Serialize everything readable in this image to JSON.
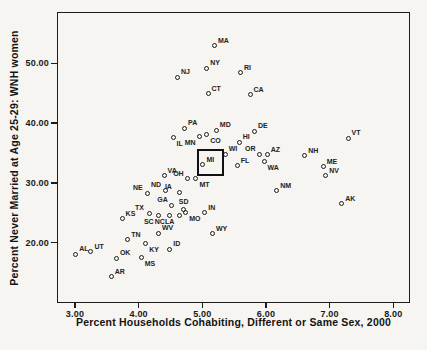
{
  "colors": {
    "background": "#f6f5f2",
    "frame": "#1c1c1c",
    "marker_outline": "#1c1c1c",
    "text": "#141414"
  },
  "chart_data": {
    "type": "scatter",
    "title": "",
    "xlabel": "Percent Households Cohabiting, Different or Same Sex, 2000",
    "ylabel": "Percent Never Married at Age 25-29:  WNH women",
    "xlim": [
      2.72,
      8.26
    ],
    "ylim": [
      10,
      58.5
    ],
    "grid": "off",
    "legend": "none",
    "marker": "open-circle",
    "x_ticks": [
      3,
      4,
      5,
      6,
      7,
      8
    ],
    "x_tick_labels": [
      "3.00",
      "4.00",
      "5.00",
      "6.00",
      "7.00",
      "8.00"
    ],
    "y_ticks": [
      20,
      30,
      40,
      50
    ],
    "y_tick_labels": [
      "20.00",
      "30.00",
      "40.00",
      "50.00"
    ],
    "highlight_square": {
      "x0": 4.92,
      "y0": 31.1,
      "x1": 5.34,
      "y1": 35.6
    },
    "points": [
      {
        "label": "AL",
        "x": 3.01,
        "y": 18.1,
        "label_pos": "ur"
      },
      {
        "label": "UT",
        "x": 3.25,
        "y": 18.5,
        "label_pos": "ur"
      },
      {
        "label": "AR",
        "x": 3.57,
        "y": 14.3,
        "label_pos": "ur"
      },
      {
        "label": "OK",
        "x": 3.65,
        "y": 17.4,
        "label_pos": "ur"
      },
      {
        "label": "KS",
        "x": 3.74,
        "y": 24.0,
        "label_pos": "ur"
      },
      {
        "label": "TN",
        "x": 3.83,
        "y": 20.5,
        "label_pos": "ur"
      },
      {
        "label": "MS",
        "x": 4.04,
        "y": 17.5,
        "label_pos": "br"
      },
      {
        "label": "KY",
        "x": 4.11,
        "y": 19.9,
        "label_pos": "br"
      },
      {
        "label": "NE",
        "x": 4.14,
        "y": 28.3,
        "label_pos": "ul"
      },
      {
        "label": "TX",
        "x": 4.17,
        "y": 24.9,
        "label_pos": "ul"
      },
      {
        "label": "SC",
        "x": 4.31,
        "y": 24.5,
        "label_pos": "bl"
      },
      {
        "label": "WV",
        "x": 4.31,
        "y": 21.6,
        "label_pos": "ur"
      },
      {
        "label": "VA",
        "x": 4.4,
        "y": 31.2,
        "label_pos": "ur"
      },
      {
        "label": "ND",
        "x": 4.42,
        "y": 28.8,
        "label_pos": "ul"
      },
      {
        "label": "NC",
        "x": 4.48,
        "y": 24.6,
        "label_pos": "bl"
      },
      {
        "label": "ID",
        "x": 4.49,
        "y": 18.9,
        "label_pos": "ur"
      },
      {
        "label": "GA",
        "x": 4.52,
        "y": 26.3,
        "label_pos": "ul"
      },
      {
        "label": "IL",
        "x": 4.54,
        "y": 37.6,
        "label_pos": "br"
      },
      {
        "label": "NJ",
        "x": 4.61,
        "y": 47.7,
        "label_pos": "ur"
      },
      {
        "label": "IA",
        "x": 4.64,
        "y": 28.4,
        "label_pos": "ul"
      },
      {
        "label": "LA",
        "x": 4.64,
        "y": 24.5,
        "label_pos": "bl"
      },
      {
        "label": "SD",
        "x": 4.71,
        "y": 25.6,
        "label_pos": "a"
      },
      {
        "label": "PA",
        "x": 4.72,
        "y": 39.1,
        "label_pos": "ur"
      },
      {
        "label": "MO",
        "x": 4.74,
        "y": 25.0,
        "label_pos": "br"
      },
      {
        "label": "OH",
        "x": 4.77,
        "y": 30.7,
        "label_pos": "ul"
      },
      {
        "label": "MT",
        "x": 4.9,
        "y": 30.7,
        "label_pos": "br"
      },
      {
        "label": "MN",
        "x": 4.95,
        "y": 37.8,
        "label_pos": "bl"
      },
      {
        "label": "MI",
        "x": 5.01,
        "y": 33.0,
        "label_pos": "ur"
      },
      {
        "label": "IN",
        "x": 5.04,
        "y": 25.0,
        "label_pos": "ur"
      },
      {
        "label": "NY",
        "x": 5.07,
        "y": 49.2,
        "label_pos": "ur"
      },
      {
        "label": "CO",
        "x": 5.07,
        "y": 38.1,
        "label_pos": "br"
      },
      {
        "label": "CT",
        "x": 5.09,
        "y": 44.9,
        "label_pos": "ur"
      },
      {
        "label": "WY",
        "x": 5.16,
        "y": 21.5,
        "label_pos": "ur"
      },
      {
        "label": "MA",
        "x": 5.19,
        "y": 52.9,
        "label_pos": "ur"
      },
      {
        "label": "MD",
        "x": 5.22,
        "y": 38.8,
        "label_pos": "ur"
      },
      {
        "label": "WI",
        "x": 5.36,
        "y": 34.8,
        "label_pos": "ur"
      },
      {
        "label": "FL",
        "x": 5.55,
        "y": 32.9,
        "label_pos": "ur"
      },
      {
        "label": "HI",
        "x": 5.58,
        "y": 36.8,
        "label_pos": "ur"
      },
      {
        "label": "RI",
        "x": 5.6,
        "y": 48.4,
        "label_pos": "ur"
      },
      {
        "label": "CA",
        "x": 5.75,
        "y": 44.7,
        "label_pos": "ur"
      },
      {
        "label": "DE",
        "x": 5.82,
        "y": 38.6,
        "label_pos": "ur"
      },
      {
        "label": "OR",
        "x": 5.9,
        "y": 34.8,
        "label_pos": "ul"
      },
      {
        "label": "WA",
        "x": 5.97,
        "y": 33.5,
        "label_pos": "br"
      },
      {
        "label": "AZ",
        "x": 6.02,
        "y": 34.7,
        "label_pos": "ur"
      },
      {
        "label": "NM",
        "x": 6.17,
        "y": 28.7,
        "label_pos": "ur"
      },
      {
        "label": "NH",
        "x": 6.61,
        "y": 34.5,
        "label_pos": "ur"
      },
      {
        "label": "ME",
        "x": 6.9,
        "y": 32.7,
        "label_pos": "ur"
      },
      {
        "label": "NV",
        "x": 6.94,
        "y": 31.2,
        "label_pos": "ur"
      },
      {
        "label": "AK",
        "x": 7.19,
        "y": 26.5,
        "label_pos": "ur"
      },
      {
        "label": "VT",
        "x": 7.29,
        "y": 37.5,
        "label_pos": "ur"
      }
    ]
  }
}
